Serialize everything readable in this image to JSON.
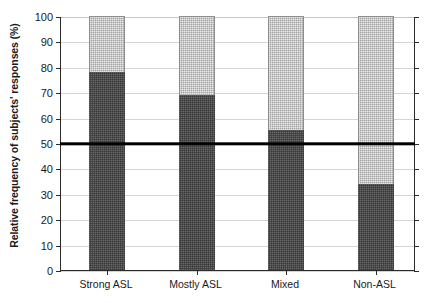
{
  "chart_data": {
    "type": "bar",
    "stacked": true,
    "title": "",
    "subtitle": "",
    "xlabel": "",
    "ylabel": "Relative frequency of subjects' responses (%)",
    "categories": [
      "Strong ASL",
      "Mostly ASL",
      "Mixed",
      "Non-ASL"
    ],
    "series": [
      {
        "name": "dark-segment",
        "color": "#4b4b4b",
        "values": [
          78,
          69,
          55,
          34
        ]
      },
      {
        "name": "light-segment",
        "color": "#c9c9c9",
        "values": [
          22,
          31,
          45,
          66
        ]
      }
    ],
    "ylim": [
      0,
      100
    ],
    "y_ticks": [
      0,
      10,
      20,
      30,
      40,
      50,
      60,
      70,
      80,
      90,
      100
    ],
    "y_tick_labels": [
      "0",
      "10",
      "20",
      "30",
      "40",
      "50",
      "60",
      "70",
      "80",
      "90",
      "100"
    ],
    "grid": true,
    "legend": "none",
    "annotations": [
      {
        "name": "reference-line",
        "type": "horizontal-line",
        "value": 50,
        "color": "#000000",
        "label": ""
      }
    ]
  },
  "axis": {
    "y_title": "Relative frequency of subjects' responses (%)"
  }
}
